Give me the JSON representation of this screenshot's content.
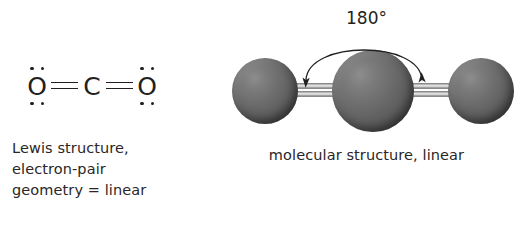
{
  "figure": {
    "background_color": "#ffffff",
    "ink_color": "#231f20"
  },
  "lewis": {
    "formula_label": "O=C=O",
    "atoms": [
      {
        "symbol": "O",
        "lone_pairs_top": 2,
        "lone_pairs_bottom": 2
      },
      {
        "symbol": "C",
        "lone_pairs_top": 0,
        "lone_pairs_bottom": 0
      },
      {
        "symbol": "O",
        "lone_pairs_top": 2,
        "lone_pairs_bottom": 2
      }
    ],
    "bonds": [
      {
        "order": 2,
        "label": "double bond"
      },
      {
        "order": 2,
        "label": "double bond"
      }
    ],
    "caption_lines": [
      "Lewis structure,",
      "electron-pair",
      "geometry = linear"
    ]
  },
  "model": {
    "angle_label": "180°",
    "caption": "molecular structure, linear",
    "sphere_color": "#6e6e6e",
    "bond_color": "#b8b8b8",
    "atoms": [
      {
        "name": "oxygen-left",
        "size": "medium"
      },
      {
        "name": "carbon-center",
        "size": "large"
      },
      {
        "name": "oxygen-right",
        "size": "medium"
      }
    ],
    "bonds": [
      {
        "name": "bond-left",
        "order": 2
      },
      {
        "name": "bond-right",
        "order": 2
      }
    ]
  }
}
